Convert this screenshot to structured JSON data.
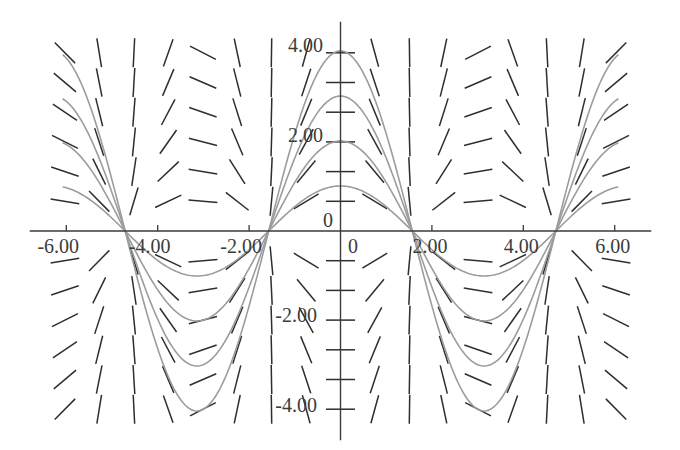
{
  "chart_data": {
    "type": "line",
    "title": "",
    "xlabel": "",
    "ylabel": "",
    "xlim": [
      -6.8,
      6.8
    ],
    "ylim": [
      -4.65,
      4.65
    ],
    "grid": false,
    "legend": null,
    "x_ticks": [
      {
        "value": -6,
        "label": "-6.00"
      },
      {
        "value": -4,
        "label": "-4.00"
      },
      {
        "value": -2,
        "label": "-2.00"
      },
      {
        "value": 2,
        "label": "2.00"
      },
      {
        "value": 4,
        "label": "4.00"
      },
      {
        "value": 6,
        "label": "6.00"
      }
    ],
    "y_ticks": [
      {
        "value": 4,
        "label": "4.00"
      },
      {
        "value": 2,
        "label": "2.00"
      },
      {
        "value": -2,
        "label": "-2.00"
      },
      {
        "value": -4,
        "label": "-4.00"
      }
    ],
    "origin_labels": {
      "x": "0",
      "y": "0"
    },
    "slope_field": {
      "description": "direction field of dy/dx = -y·tan(x)",
      "x_positions": [
        -6.03,
        -5.28,
        -4.52,
        -3.77,
        -3.01,
        -2.26,
        -1.51,
        -0.75,
        0,
        0.75,
        1.51,
        2.26,
        3.01,
        3.77,
        4.52,
        5.28,
        6.03
      ],
      "y_positions": [
        3.96,
        3.3,
        2.64,
        1.98,
        1.32,
        0.66,
        -0.66,
        -1.32,
        -1.98,
        -2.64,
        -3.3,
        -3.96
      ],
      "color": "#2e2e2e"
    },
    "series": [
      {
        "name": "y = 1·cos(x)",
        "amplitude": 1,
        "x_range": [
          -6.08,
          6.08
        ],
        "color": "#9c9c9c",
        "x": [
          -6.08,
          -4.71,
          -3.14,
          -1.57,
          0,
          1.57,
          3.14,
          4.71,
          6.08
        ],
        "y": [
          0.98,
          0,
          -1,
          0,
          1,
          0,
          -1,
          0,
          0.98
        ]
      },
      {
        "name": "y = 2·cos(x)",
        "amplitude": 2,
        "x_range": [
          -6.08,
          6.08
        ],
        "color": "#9c9c9c",
        "x": [
          -6.08,
          -4.71,
          -3.14,
          -1.57,
          0,
          1.57,
          3.14,
          4.71,
          6.08
        ],
        "y": [
          1.96,
          0,
          -2,
          0,
          2,
          0,
          -2,
          0,
          1.96
        ]
      },
      {
        "name": "y = 3·cos(x)",
        "amplitude": 3,
        "x_range": [
          -6.08,
          6.08
        ],
        "color": "#9c9c9c",
        "x": [
          -6.08,
          -4.71,
          -3.14,
          -1.57,
          0,
          1.57,
          3.14,
          4.71,
          6.08
        ],
        "y": [
          2.94,
          0,
          -3,
          0,
          3,
          0,
          -3,
          0,
          2.94
        ]
      },
      {
        "name": "y = 4·cos(x)",
        "amplitude": 4,
        "x_range": [
          -6.08,
          6.08
        ],
        "color": "#9c9c9c",
        "x": [
          -6.08,
          -4.71,
          -3.14,
          -1.57,
          0,
          1.57,
          3.14,
          4.71,
          6.08
        ],
        "y": [
          3.92,
          0,
          -4,
          0,
          4,
          0,
          -4,
          0,
          3.92
        ]
      }
    ]
  }
}
